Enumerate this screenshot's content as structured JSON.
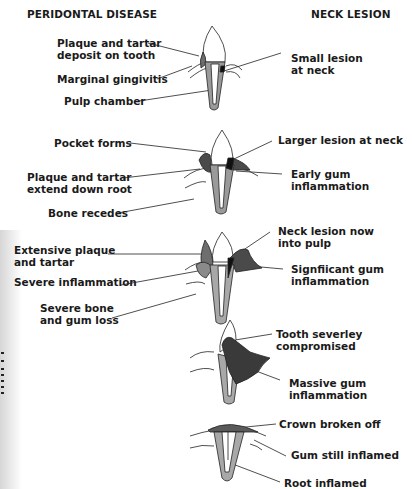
{
  "headings": {
    "left": "PERIDONTAL DISEASE",
    "right": "NECK LESION"
  },
  "stages": [
    {
      "left_labels": [
        "Plaque and tartar\ndeposit on tooth",
        "Marginal gingivitis",
        "Pulp chamber"
      ],
      "right_labels": [
        "Small lesion\nat neck"
      ]
    },
    {
      "left_labels": [
        "Pocket forms",
        "Plaque and tartar\nextend down root",
        "Bone recedes"
      ],
      "right_labels": [
        "Larger lesion at neck",
        "Early gum\ninflammation"
      ]
    },
    {
      "left_labels": [
        "Extensive plaque\nand tartar",
        "Severe inflammation",
        "Severe bone\nand gum loss"
      ],
      "right_labels": [
        "Neck lesion now\ninto pulp",
        "Signfiicant gum\ninflammation"
      ]
    },
    {
      "left_labels": [],
      "right_labels": [
        "Tooth severley compromised",
        "Massive gum\ninflammation"
      ]
    },
    {
      "left_labels": [],
      "right_labels": [
        "Crown broken off",
        "Gum still inflamed",
        "Root inflamed"
      ]
    }
  ],
  "colors": {
    "outline": "#222222",
    "plaque": "#6e6e6e",
    "lesion": "#111111",
    "gum_inflamed": "#4a4a4a",
    "dentin": "#a8a8a8",
    "gum_light": "#e6e6e6"
  }
}
